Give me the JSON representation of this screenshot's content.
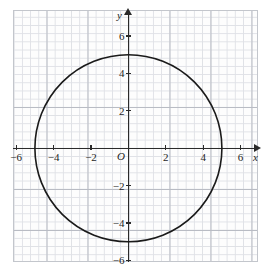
{
  "page": {
    "top_text_fragment": "",
    "background_color": "#ffffff"
  },
  "graph": {
    "grid_major_color": "#b9bcc4",
    "grid_minor_color": "#dfe1e6",
    "axis_color": "#2a2a2a",
    "curve_color": "#1a1a1a",
    "origin_label": "O",
    "x_axis_name": "x",
    "y_axis_name": "y",
    "x_tick_labels": [
      "−6",
      "−4",
      "−2",
      "2",
      "4",
      "6"
    ],
    "y_tick_labels": [
      "6",
      "4",
      "2",
      "−2",
      "−4",
      "−6"
    ]
  },
  "chart_data": {
    "type": "line",
    "title": "",
    "xlabel": "x",
    "ylabel": "y",
    "xlim": [
      -6.8,
      6.8
    ],
    "ylim": [
      -6.4,
      6.6
    ],
    "grid": true,
    "legend": "none",
    "x_ticks": [
      -6,
      -4,
      -2,
      2,
      4,
      6
    ],
    "y_ticks": [
      6,
      4,
      2,
      -2,
      -4,
      -6
    ],
    "x_tick_labels": [
      "−6",
      "−4",
      "−2",
      "2",
      "4",
      "6"
    ],
    "y_tick_labels": [
      "6",
      "4",
      "2",
      "−2",
      "−4",
      "−6"
    ],
    "minor_grid_step": 0.4,
    "major_grid_step": 2,
    "annotations": [
      "O"
    ],
    "series": [
      {
        "name": "circle",
        "shape": "circle",
        "center": [
          0,
          0
        ],
        "radius": 5,
        "equation": "x² + y² = 25",
        "stroke": "#1a1a1a",
        "stroke_width": 1.6,
        "fill": "none"
      }
    ]
  }
}
